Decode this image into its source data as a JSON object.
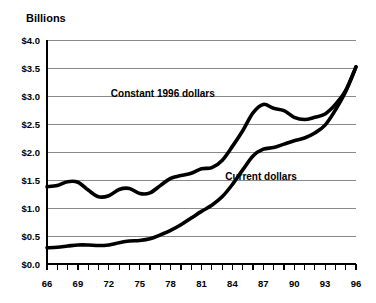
{
  "chart_data": {
    "type": "line",
    "title": "",
    "ylabel": "Billions",
    "xlabel": "",
    "ylim": [
      0.0,
      4.0
    ],
    "xlim": [
      66,
      96
    ],
    "grid": true,
    "legend_position": "inline-annotation",
    "ytick_labels": [
      "$4.0",
      "$3.5",
      "$3.0",
      "$2.5",
      "$2.0",
      "$1.5",
      "$1.0",
      "$0.5",
      "$0.0"
    ],
    "ytick_values": [
      4.0,
      3.5,
      3.0,
      2.5,
      2.0,
      1.5,
      1.0,
      0.5,
      0.0
    ],
    "xtick_labels": [
      "66",
      "69",
      "72",
      "75",
      "78",
      "81",
      "84",
      "87",
      "90",
      "93",
      "96"
    ],
    "xtick_values": [
      66,
      69,
      72,
      75,
      78,
      81,
      84,
      87,
      90,
      93,
      96
    ],
    "x": [
      66,
      67,
      68,
      69,
      70,
      71,
      72,
      73,
      74,
      75,
      76,
      77,
      78,
      79,
      80,
      81,
      82,
      83,
      84,
      85,
      86,
      87,
      88,
      89,
      90,
      91,
      92,
      93,
      94,
      95,
      96
    ],
    "series": [
      {
        "name": "Constant 1996 dollars",
        "values": [
          1.38,
          1.4,
          1.47,
          1.46,
          1.32,
          1.2,
          1.22,
          1.33,
          1.35,
          1.26,
          1.27,
          1.4,
          1.53,
          1.58,
          1.62,
          1.7,
          1.72,
          1.85,
          2.1,
          2.38,
          2.7,
          2.85,
          2.78,
          2.74,
          2.62,
          2.58,
          2.62,
          2.68,
          2.85,
          3.1,
          3.52
        ]
      },
      {
        "name": "Current dollars",
        "values": [
          0.29,
          0.3,
          0.32,
          0.34,
          0.34,
          0.33,
          0.34,
          0.38,
          0.41,
          0.42,
          0.45,
          0.52,
          0.6,
          0.7,
          0.82,
          0.94,
          1.05,
          1.2,
          1.42,
          1.68,
          1.93,
          2.05,
          2.08,
          2.14,
          2.2,
          2.25,
          2.34,
          2.48,
          2.75,
          3.08,
          3.52
        ]
      }
    ],
    "annotations": [
      {
        "text": "Constant 1996 dollars",
        "x": 72.2,
        "y": 2.98
      },
      {
        "text": "Current dollars",
        "x": 83.3,
        "y": 1.5
      }
    ]
  }
}
